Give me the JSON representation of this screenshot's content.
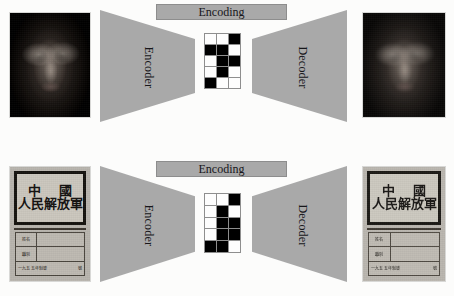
{
  "figure": {
    "background_color": "#fcfcfb",
    "shape_color": "#a9a9a9",
    "code_on_color": "#000000",
    "code_off_color": "#fdfdfd"
  },
  "rows": [
    {
      "id": "face-row",
      "banner_label": "Encoding",
      "encoder_label": "Encoder",
      "decoder_label": "Decoder",
      "input_caption": "",
      "output_caption": "",
      "code_grid": {
        "columns": 3,
        "rows": 5,
        "cells": [
          [
            0,
            0,
            1
          ],
          [
            1,
            1,
            0
          ],
          [
            0,
            1,
            1
          ],
          [
            0,
            1,
            0
          ],
          [
            1,
            0,
            0
          ]
        ]
      }
    },
    {
      "id": "sign-row",
      "banner_label": "Encoding",
      "encoder_label": "Encoder",
      "decoder_label": "Decoder",
      "input_caption": "",
      "output_caption": "",
      "code_grid": {
        "columns": 3,
        "rows": 5,
        "cells": [
          [
            0,
            0,
            1
          ],
          [
            0,
            1,
            0
          ],
          [
            0,
            1,
            1
          ],
          [
            0,
            1,
            1
          ],
          [
            1,
            1,
            0
          ]
        ]
      }
    }
  ],
  "sign_content": {
    "headline_line1": "中 國",
    "headline_line2": "人民解放軍",
    "table_rows": [
      {
        "label": "姓名",
        "value": ""
      },
      {
        "label": "職別",
        "value": ""
      }
    ],
    "footer_left": "一九五五年制發",
    "footer_right": "號"
  }
}
